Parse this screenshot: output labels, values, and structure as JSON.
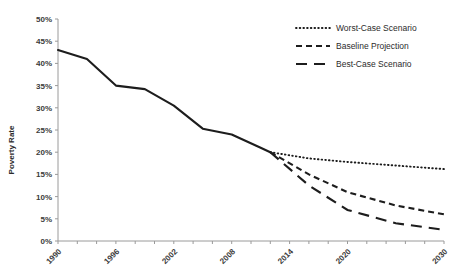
{
  "chart_data": {
    "type": "line",
    "title": "",
    "xlabel": "",
    "ylabel": "Poverty Rate",
    "xlim": [
      1990,
      2030
    ],
    "ylim": [
      0,
      50
    ],
    "y_tick_step": 5,
    "grid": false,
    "legend_position": "top-right",
    "x_tick_labels": [
      "1990",
      "1996",
      "2002",
      "2008",
      "2014",
      "2020",
      "2030"
    ],
    "x_tick_values": [
      1990,
      1996,
      2002,
      2008,
      2014,
      2020,
      2030
    ],
    "x_minor_tick_step": 2,
    "y_tick_labels": [
      "0%",
      "5%",
      "10%",
      "15%",
      "20%",
      "25%",
      "30%",
      "35%",
      "40%",
      "45%",
      "50%"
    ],
    "y_tick_values": [
      0,
      5,
      10,
      15,
      20,
      25,
      30,
      35,
      40,
      45,
      50
    ],
    "series": [
      {
        "name": "Historical",
        "style": "solid",
        "in_legend": false,
        "x": [
          1990,
          1993,
          1996,
          1999,
          2002,
          2005,
          2008,
          2011,
          2012
        ],
        "values": [
          43.0,
          41.0,
          35.0,
          34.2,
          30.5,
          25.3,
          24.0,
          21.0,
          20.0
        ]
      },
      {
        "name": "Worst-Case Scenario",
        "style": "dotted",
        "in_legend": true,
        "x": [
          2012,
          2016,
          2020,
          2025,
          2030
        ],
        "values": [
          20.0,
          18.6,
          17.8,
          17.0,
          16.2
        ]
      },
      {
        "name": "Baseline Projection",
        "style": "dashed",
        "in_legend": true,
        "x": [
          2012,
          2016,
          2020,
          2025,
          2030
        ],
        "values": [
          20.0,
          15.0,
          11.0,
          8.0,
          6.0
        ]
      },
      {
        "name": "Best-Case Scenario",
        "style": "long-dashed",
        "in_legend": true,
        "x": [
          2012,
          2016,
          2020,
          2025,
          2030
        ],
        "values": [
          20.0,
          12.5,
          7.0,
          4.0,
          2.5
        ]
      }
    ],
    "legend": [
      {
        "label": "Worst-Case Scenario",
        "style": "dotted"
      },
      {
        "label": "Baseline Projection",
        "style": "dashed"
      },
      {
        "label": "Best-Case Scenario",
        "style": "long-dashed"
      }
    ],
    "colors": {
      "series": "#1d1d1d",
      "axis": "#9a9a9a",
      "text": "#2b2b2b",
      "background": "#ffffff"
    }
  }
}
